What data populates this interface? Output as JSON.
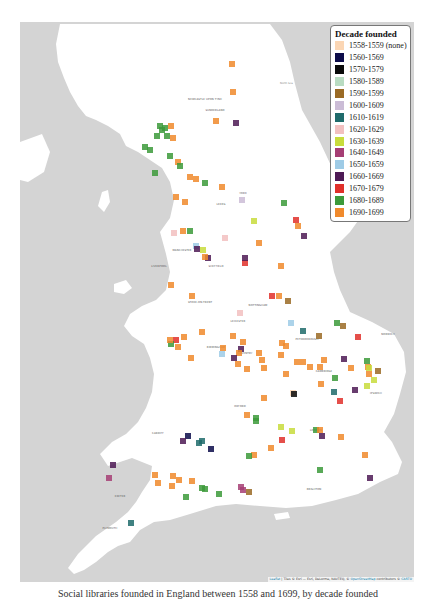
{
  "legend": {
    "title": "Decade founded",
    "items": [
      {
        "label": "1558-1559 (none)",
        "color": "#fbd6b4"
      },
      {
        "label": "1560-1569",
        "color": "#0c0c4a"
      },
      {
        "label": "1570-1579",
        "color": "#0a0a0a"
      },
      {
        "label": "1580-1589",
        "color": "#b9dcc2"
      },
      {
        "label": "1590-1599",
        "color": "#9a6a25"
      },
      {
        "label": "1600-1609",
        "color": "#cbbcd6"
      },
      {
        "label": "1610-1619",
        "color": "#1f6b6b"
      },
      {
        "label": "1620-1629",
        "color": "#f2c0c0"
      },
      {
        "label": "1630-1639",
        "color": "#c8dc3c"
      },
      {
        "label": "1640-1649",
        "color": "#a63e74"
      },
      {
        "label": "1650-1659",
        "color": "#9ecbe6"
      },
      {
        "label": "1660-1669",
        "color": "#4e1a55"
      },
      {
        "label": "1670-1679",
        "color": "#e0302a"
      },
      {
        "label": "1680-1689",
        "color": "#3c9a3a"
      },
      {
        "label": "1690-1699",
        "color": "#f08a2c"
      }
    ]
  },
  "places": [
    {
      "name": "GLASGOW",
      "x": 55,
      "y": 19
    },
    {
      "name": "EDINBURGH",
      "x": 100,
      "y": 10
    },
    {
      "name": "NEWCASTLE UPON TYNE",
      "x": 205,
      "y": 99
    },
    {
      "name": "SUNDERLAND",
      "x": 215,
      "y": 110
    },
    {
      "name": "YORK",
      "x": 243,
      "y": 193
    },
    {
      "name": "LEEDS",
      "x": 221,
      "y": 204
    },
    {
      "name": "MANCHESTER",
      "x": 182,
      "y": 250
    },
    {
      "name": "SHEFFIELD",
      "x": 216,
      "y": 266
    },
    {
      "name": "LIVERPOOL",
      "x": 159,
      "y": 266
    },
    {
      "name": "STOKE-ON-TRENT",
      "x": 200,
      "y": 302
    },
    {
      "name": "NOTTINGHAM",
      "x": 258,
      "y": 305
    },
    {
      "name": "LEICESTER",
      "x": 238,
      "y": 321
    },
    {
      "name": "BIRMINGHAM",
      "x": 216,
      "y": 347
    },
    {
      "name": "COVENTRY",
      "x": 245,
      "y": 353
    },
    {
      "name": "PETERBOROUGH",
      "x": 307,
      "y": 339
    },
    {
      "name": "CAMBRIDGE",
      "x": 324,
      "y": 371
    },
    {
      "name": "NORWICH",
      "x": 388,
      "y": 334
    },
    {
      "name": "IPSWICH",
      "x": 376,
      "y": 393
    },
    {
      "name": "OXFORD",
      "x": 240,
      "y": 406
    },
    {
      "name": "LONDON",
      "x": 316,
      "y": 430
    },
    {
      "name": "CARDIFF",
      "x": 158,
      "y": 433
    },
    {
      "name": "BRIGHTON",
      "x": 314,
      "y": 489
    },
    {
      "name": "EXETER",
      "x": 120,
      "y": 496
    },
    {
      "name": "PLYMOUTH",
      "x": 110,
      "y": 528
    }
  ],
  "attribution": {
    "leaflet": "Leaflet",
    "tiles": " | Tiles © Esri — Esri, DeLorme, NAVTEQ, © ",
    "osm": "OpenStreetMap",
    "contrib": " contributors © ",
    "carto": "CARTO"
  },
  "caption": "Social libraries founded in England between 1558 and 1699, by decade founded"
}
